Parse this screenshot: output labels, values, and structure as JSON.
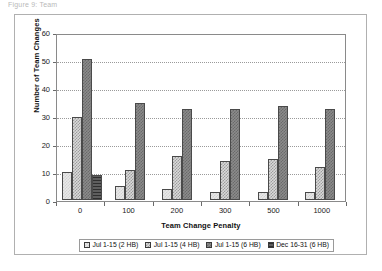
{
  "caption": {
    "fragment": "Figure 9: Team"
  },
  "chart_data": {
    "type": "bar",
    "title": "",
    "xlabel": "Team Change Penalty",
    "ylabel": "Number of Team Changes",
    "categories": [
      "0",
      "100",
      "200",
      "300",
      "500",
      "1000"
    ],
    "ylim": [
      0,
      60
    ],
    "yticks": [
      0,
      10,
      20,
      30,
      40,
      50,
      60
    ],
    "grid": true,
    "legend_position": "bottom",
    "series": [
      {
        "name": "Jul 1-15 (2 HB)",
        "color": "#e8e8e8",
        "values": [
          10,
          5,
          4,
          3,
          3,
          3
        ]
      },
      {
        "name": "Jul 1-15 (4 HB)",
        "color": "#d9d9d9",
        "values": [
          30,
          11,
          16,
          14,
          15,
          12
        ]
      },
      {
        "name": "Jul 1-15 (6 HB)",
        "color": "#8b8b8b",
        "values": [
          51,
          35,
          33,
          33,
          34,
          33
        ]
      },
      {
        "name": "Dec 16-31 (6 HB)",
        "color": "#2f2f2f",
        "values": [
          9,
          0,
          0,
          0,
          0,
          0
        ]
      }
    ]
  }
}
